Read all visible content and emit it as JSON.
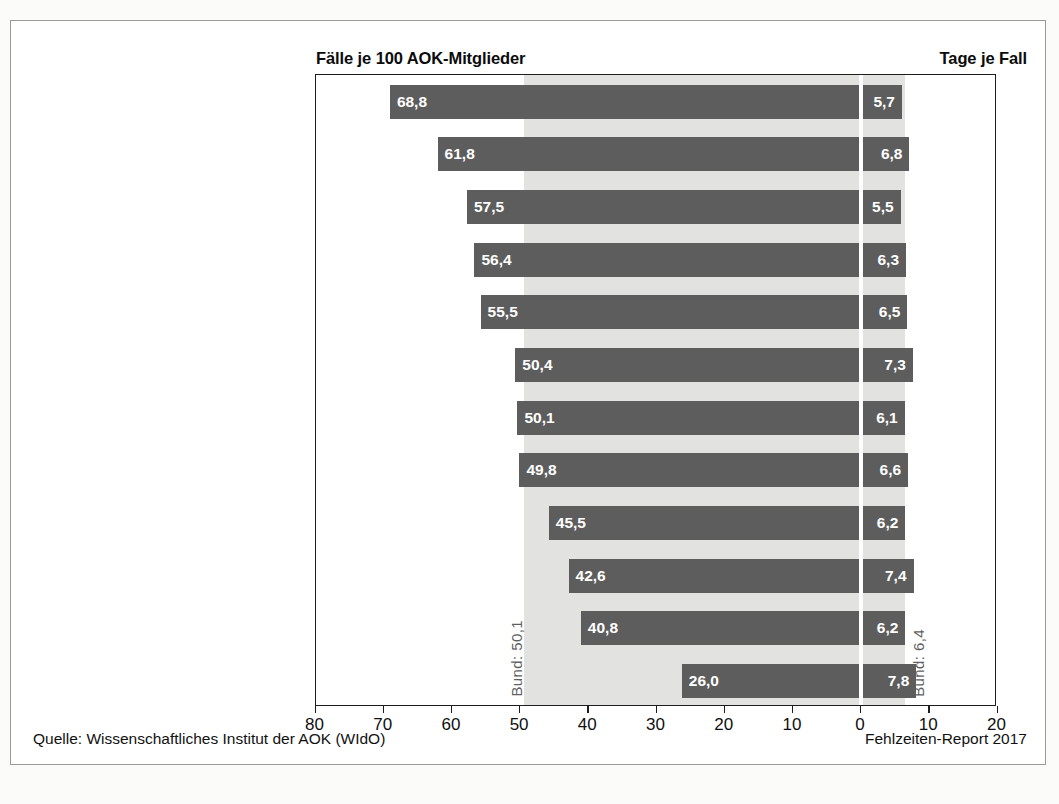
{
  "header": {
    "left_title": "Fälle je 100 AOK-Mitglieder",
    "right_title": "Tage je Fall"
  },
  "reference": {
    "left_label": "Bund: 50,1",
    "right_label": "Bund: 6,4",
    "left_value": 50.1,
    "right_value": 6.4
  },
  "footer": {
    "source": "Quelle: Wissenschaftliches Institut der AOK (WIdO)",
    "report": "Fehlzeiten-Report 2017"
  },
  "axis": {
    "labels": [
      "80",
      "70",
      "60",
      "50",
      "40",
      "30",
      "20",
      "10",
      "0",
      "10",
      "20"
    ],
    "positions": [
      80,
      70,
      60,
      50,
      40,
      30,
      20,
      10,
      0,
      10,
      20
    ]
  },
  "rows": [
    {
      "category": "Erziehung und Unterricht",
      "left": "68,8",
      "right": "5,7"
    },
    {
      "category": "Öffentl. Verwaltung/\nSozialversicherung",
      "left": "61,8",
      "right": "6,8"
    },
    {
      "category": "Banken/Versicherungen",
      "left": "57,5",
      "right": "5,5"
    },
    {
      "category": "Metallindustrie",
      "left": "56,4",
      "right": "6,3"
    },
    {
      "category": "Gesundheits- und Sozialwesen",
      "left": "55,5",
      "right": "6,5"
    },
    {
      "category": "Energie/Wasser/Entsorgung/\nBergbau",
      "left": "50,4",
      "right": "7,3"
    },
    {
      "category": "Handel",
      "left": "50,1",
      "right": "6,1"
    },
    {
      "category": "Verarbeitendes Gewerbe",
      "left": "49,8",
      "right": "6,6"
    },
    {
      "category": "Dienstleistungen",
      "left": "45,5",
      "right": "6,2"
    },
    {
      "category": "Verkehr/Transport",
      "left": "42,6",
      "right": "7,4"
    },
    {
      "category": "Baugewerbe",
      "left": "40,8",
      "right": "6,2"
    },
    {
      "category": "Land- und Forstwirtschaft",
      "left": "26,0",
      "right": "7,8"
    }
  ],
  "colors": {
    "bar": "#5d5d5d",
    "band": "#e2e2e0",
    "frame": "#9a9a9a",
    "axis": "#1d1d1d",
    "value_text": "#ffffff",
    "reference_text": "#5f5f5f"
  },
  "chart_data": {
    "type": "bar",
    "title": "",
    "subtitle": "",
    "orientation": "horizontal-bidirectional",
    "categories": [
      "Erziehung und Unterricht",
      "Öffentl. Verwaltung/Sozialversicherung",
      "Banken/Versicherungen",
      "Metallindustrie",
      "Gesundheits- und Sozialwesen",
      "Energie/Wasser/Entsorgung/Bergbau",
      "Handel",
      "Verarbeitendes Gewerbe",
      "Dienstleistungen",
      "Verkehr/Transport",
      "Baugewerbe",
      "Land- und Forstwirtschaft"
    ],
    "series": [
      {
        "name": "Fälle je 100 AOK-Mitglieder",
        "side": "left",
        "values": [
          68.8,
          61.8,
          57.5,
          56.4,
          55.5,
          50.4,
          50.1,
          49.8,
          45.5,
          42.6,
          40.8,
          26.0
        ],
        "axis_range": [
          80,
          0
        ],
        "reference_line": 50.1,
        "reference_label": "Bund: 50,1"
      },
      {
        "name": "Tage je Fall",
        "side": "right",
        "values": [
          5.7,
          6.8,
          5.5,
          6.3,
          6.5,
          7.3,
          6.1,
          6.6,
          6.2,
          7.4,
          6.2,
          7.8
        ],
        "axis_range": [
          0,
          20
        ],
        "reference_line": 6.4,
        "reference_label": "Bund: 6,4"
      }
    ],
    "xlabel": "",
    "ylabel": "",
    "xticks": [
      80,
      70,
      60,
      50,
      40,
      30,
      20,
      10,
      0,
      10,
      20
    ],
    "grid": false,
    "legend": "none",
    "source": "Quelle: Wissenschaftliches Institut der AOK (WIdO)",
    "annotation": "Fehlzeiten-Report 2017"
  }
}
